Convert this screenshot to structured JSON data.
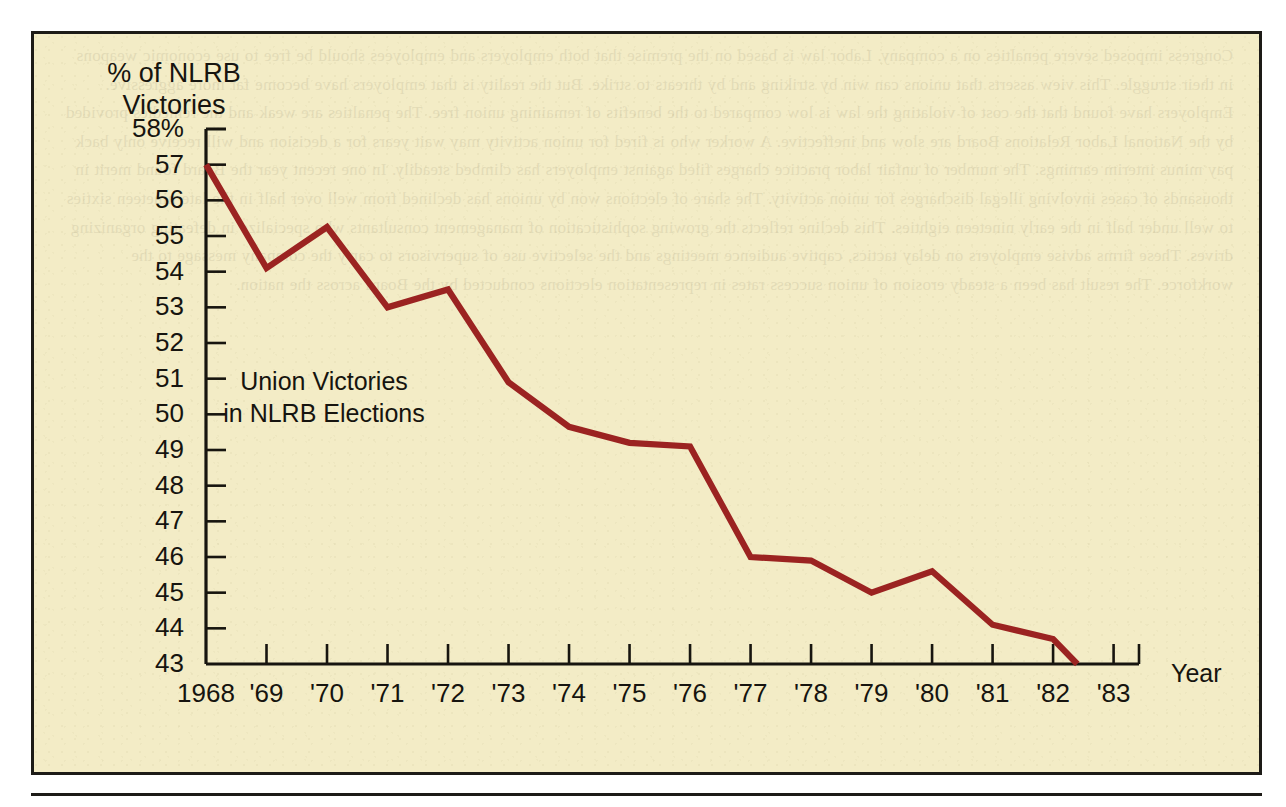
{
  "panel": {
    "background_color": "#f3ecc6",
    "border_color": "#1d1b17"
  },
  "axis_titles": {
    "y_line1": "% of NLRB",
    "y_line2": "Victories",
    "x_title": "Year"
  },
  "annotation": {
    "line1": "Union Victories",
    "line2": "in NLRB Elections"
  },
  "ghost": {
    "text": "Congress imposed severe penalties on a company. Labor law is based on the premise that both employers and employees should be free to use economic weapons in their struggle. This view asserts that unions can win by striking and by threats to strike. But the reality is that employers have become far more aggressive. Employers have found that the cost of violating the law is low compared to the benefits of remaining union free. The penalties are weak and the remedies provided by the National Labor Relations Board are slow and ineffective. A worker who is fired for union activity may wait years for a decision and will receive only back pay minus interim earnings. The number of unfair labor practice charges filed against employers has climbed steadily. In one recent year the Board found merit in thousands of cases involving illegal discharges for union activity. The share of elections won by unions has declined from well over half in the late nineteen sixties to well under half in the early nineteen eighties. This decline reflects the growing sophistication of management consultants who specialize in defeating organizing drives. These firms advise employers on delay tactics, captive audience meetings and the selective use of supervisors to carry the company message to the workforce. The result has been a steady erosion of union success rates in representation elections conducted by the Board across the nation."
  },
  "chart_data": {
    "type": "line",
    "title": "",
    "xlabel": "Year",
    "ylabel": "% of NLRB Victories",
    "ylim": [
      43,
      58
    ],
    "grid": false,
    "legend": "none",
    "line_color": "#9b2321",
    "y_ticks": [
      "58%",
      "57",
      "56",
      "55",
      "54",
      "53",
      "52",
      "51",
      "50",
      "49",
      "48",
      "47",
      "46",
      "45",
      "44",
      "43"
    ],
    "y_tick_values": [
      58,
      57,
      56,
      55,
      54,
      53,
      52,
      51,
      50,
      49,
      48,
      47,
      46,
      45,
      44,
      43
    ],
    "categories": [
      "1968",
      "'69",
      "'70",
      "'71",
      "'72",
      "'73",
      "'74",
      "'75",
      "'76",
      "'77",
      "'78",
      "'79",
      "'80",
      "'81",
      "'82",
      "'83"
    ],
    "x_values": [
      1968,
      1969,
      1970,
      1971,
      1972,
      1973,
      1974,
      1975,
      1976,
      1977,
      1978,
      1979,
      1980,
      1981,
      1982,
      1983
    ],
    "series": [
      {
        "name": "Union Victories in NLRB Elections",
        "values": [
          57.0,
          54.1,
          55.25,
          53.0,
          53.5,
          50.9,
          49.65,
          49.2,
          49.1,
          46.0,
          45.9,
          45.0,
          45.6,
          44.1,
          43.7,
          null
        ]
      }
    ],
    "note": "Line terminates at the axis baseline shortly after the 1982 tick; no value plotted at 1983."
  }
}
